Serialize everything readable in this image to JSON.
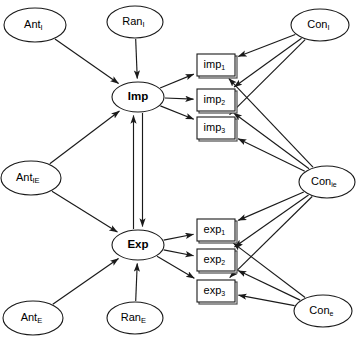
{
  "diagram": {
    "type": "path-diagram",
    "background_color": "#ffffff",
    "stroke_color": "#1a1a1a",
    "box_stroke_color": "#4d4d4d",
    "latent_nodes": [
      {
        "id": "ant_i",
        "base": "Ant",
        "sub": "I",
        "sub_case": "upper",
        "cx": 35,
        "cy": 25,
        "rx": 31,
        "ry": 17,
        "bold": false
      },
      {
        "id": "ran_i",
        "base": "Ran",
        "sub": "I",
        "sub_case": "upper",
        "cx": 135,
        "cy": 22,
        "rx": 28,
        "ry": 16,
        "bold": false
      },
      {
        "id": "con_i",
        "base": "Con",
        "sub": "I",
        "sub_case": "upper",
        "cx": 320,
        "cy": 25,
        "rx": 29,
        "ry": 16,
        "bold": false
      },
      {
        "id": "imp",
        "base": "Imp",
        "sub": "",
        "sub_case": "none",
        "cx": 138,
        "cy": 97,
        "rx": 26,
        "ry": 15,
        "bold": true
      },
      {
        "id": "ant_ie",
        "base": "Ant",
        "sub": "IE",
        "sub_case": "upper",
        "cx": 31,
        "cy": 178,
        "rx": 30,
        "ry": 17,
        "bold": false
      },
      {
        "id": "con_ie",
        "base": "Con",
        "sub": "ie",
        "sub_case": "lower",
        "cx": 327,
        "cy": 182,
        "rx": 28,
        "ry": 16,
        "bold": false
      },
      {
        "id": "exp",
        "base": "Exp",
        "sub": "",
        "sub_case": "none",
        "cx": 138,
        "cy": 245,
        "rx": 26,
        "ry": 15,
        "bold": true
      },
      {
        "id": "ant_e",
        "base": "Ant",
        "sub": "E",
        "sub_case": "upper",
        "cx": 33,
        "cy": 318,
        "rx": 30,
        "ry": 17,
        "bold": false
      },
      {
        "id": "ran_e",
        "base": "Ran",
        "sub": "E",
        "sub_case": "upper",
        "cx": 135,
        "cy": 318,
        "rx": 28,
        "ry": 16,
        "bold": false
      },
      {
        "id": "con_e",
        "base": "Con",
        "sub": "e",
        "sub_case": "lower",
        "cx": 323,
        "cy": 311,
        "rx": 29,
        "ry": 16,
        "bold": false
      }
    ],
    "observed_nodes": [
      {
        "id": "imp1",
        "base": "imp",
        "sub": "1",
        "x": 197,
        "y": 54,
        "w": 38,
        "h": 22
      },
      {
        "id": "imp2",
        "base": "imp",
        "sub": "2",
        "x": 197,
        "y": 89,
        "w": 38,
        "h": 22
      },
      {
        "id": "imp3",
        "base": "imp",
        "sub": "3",
        "x": 197,
        "y": 117,
        "w": 38,
        "h": 22
      },
      {
        "id": "exp1",
        "base": "exp",
        "sub": "1",
        "x": 197,
        "y": 219,
        "w": 38,
        "h": 22
      },
      {
        "id": "exp2",
        "base": "exp",
        "sub": "2",
        "x": 197,
        "y": 249,
        "w": 38,
        "h": 22
      },
      {
        "id": "exp3",
        "base": "exp",
        "sub": "3",
        "x": 197,
        "y": 280,
        "w": 38,
        "h": 22
      }
    ],
    "edges": [
      {
        "from": "ant_i",
        "to": "imp",
        "kind": "directed"
      },
      {
        "from": "ran_i",
        "to": "imp",
        "kind": "directed"
      },
      {
        "from": "ant_ie",
        "to": "imp",
        "kind": "directed"
      },
      {
        "from": "ant_ie",
        "to": "exp",
        "kind": "directed"
      },
      {
        "from": "ant_e",
        "to": "exp",
        "kind": "directed"
      },
      {
        "from": "ran_e",
        "to": "exp",
        "kind": "directed"
      },
      {
        "from": "imp",
        "to": "exp",
        "kind": "directed"
      },
      {
        "from": "exp",
        "to": "imp",
        "kind": "directed"
      },
      {
        "from": "imp",
        "to": "imp1",
        "kind": "directed"
      },
      {
        "from": "imp",
        "to": "imp2",
        "kind": "directed"
      },
      {
        "from": "imp",
        "to": "imp3",
        "kind": "directed"
      },
      {
        "from": "exp",
        "to": "exp1",
        "kind": "directed"
      },
      {
        "from": "exp",
        "to": "exp2",
        "kind": "directed"
      },
      {
        "from": "exp",
        "to": "exp3",
        "kind": "directed"
      },
      {
        "from": "con_i",
        "to": "imp1",
        "kind": "directed"
      },
      {
        "from": "con_i",
        "to": "imp2",
        "kind": "directed"
      },
      {
        "from": "con_i",
        "to": "imp3",
        "kind": "directed"
      },
      {
        "from": "con_ie",
        "to": "imp1",
        "kind": "directed"
      },
      {
        "from": "con_ie",
        "to": "imp2",
        "kind": "directed"
      },
      {
        "from": "con_ie",
        "to": "imp3",
        "kind": "directed"
      },
      {
        "from": "con_ie",
        "to": "exp1",
        "kind": "directed"
      },
      {
        "from": "con_ie",
        "to": "exp2",
        "kind": "directed"
      },
      {
        "from": "con_ie",
        "to": "exp3",
        "kind": "directed"
      },
      {
        "from": "con_e",
        "to": "exp1",
        "kind": "directed"
      },
      {
        "from": "con_e",
        "to": "exp2",
        "kind": "directed"
      },
      {
        "from": "con_e",
        "to": "exp3",
        "kind": "directed"
      }
    ]
  }
}
